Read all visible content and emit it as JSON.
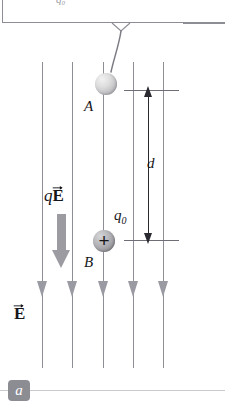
{
  "figure": {
    "panel_label": "a",
    "truncated_top_text": "q₀"
  },
  "callout": {
    "pointer_target": "charge-a"
  },
  "charges": [
    {
      "id": "A",
      "label": "A",
      "sign": "",
      "description": "neutral-gray-sphere-at-top"
    },
    {
      "id": "B",
      "label": "B",
      "sign": "+",
      "charge_symbol": "q",
      "charge_subscript": "0",
      "description": "positive-charge-sphere-at-bottom"
    }
  ],
  "field": {
    "label_letter": "E",
    "label_vector": true,
    "line_count": 5,
    "direction": "down",
    "line_x_positions": [
      42,
      72,
      103,
      133,
      163
    ]
  },
  "force": {
    "prefix": "q",
    "letter": "E",
    "vector": true,
    "direction": "down"
  },
  "dimension": {
    "label": "d",
    "from": "A",
    "to": "B"
  },
  "colors": {
    "field_line": "#8e8e96",
    "field_arrow": "#9a9aa2",
    "force_arrow": "#9b9ba1",
    "dimension": "#2a2a30",
    "badge_background": "#8c8c93",
    "text": "#16161a"
  }
}
